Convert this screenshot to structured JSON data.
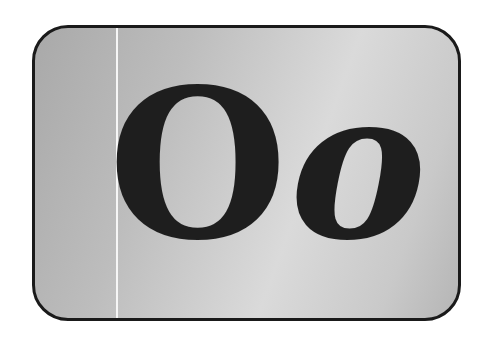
{
  "card": {
    "uppercase_letter": "O",
    "lowercase_letter": "o",
    "colors": {
      "border": "#1a1a1a",
      "text": "#1e1e1e",
      "background_dark": "#a9a9a9",
      "background_light": "#dadada",
      "guide_line": "#f6f6f6"
    }
  }
}
